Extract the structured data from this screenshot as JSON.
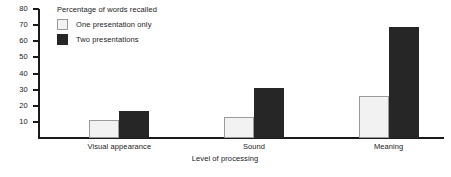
{
  "chart_data": {
    "type": "bar",
    "title": "Percentage of words recalled",
    "xlabel": "Level of processing",
    "ylabel": "",
    "categories": [
      "Visual appearance",
      "Sound",
      "Meaning"
    ],
    "series": [
      {
        "name": "One presentation only",
        "values": [
          11,
          13,
          26
        ],
        "color": "#f2f2f2"
      },
      {
        "name": "Two presentations",
        "values": [
          17,
          31,
          69
        ],
        "color": "#262626"
      }
    ],
    "ylim": [
      0,
      80
    ],
    "yticks": [
      10,
      20,
      30,
      40,
      50,
      60,
      70,
      80
    ],
    "ytick_labels": [
      "10",
      "20",
      "30",
      "40",
      "50",
      "60",
      "70",
      "80"
    ],
    "grid": false,
    "legend_position": "top-left"
  }
}
